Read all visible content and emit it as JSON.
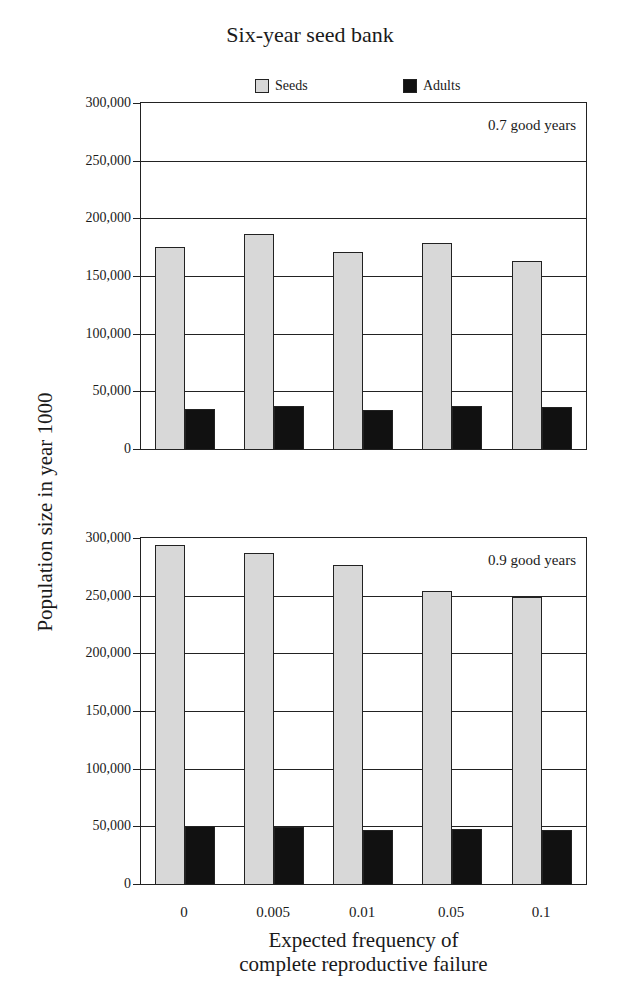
{
  "chart_data": [
    {
      "type": "bar",
      "title": "Six-year seed bank",
      "panel_label": "0.7 good years",
      "xlabel": "Expected frequency of complete reproductive failure",
      "ylabel": "Population size in year 1000",
      "categories": [
        "0",
        "0.005",
        "0.01",
        "0.05",
        "0.1"
      ],
      "series": [
        {
          "name": "Seeds",
          "values": [
            175000,
            186000,
            171000,
            179000,
            163000
          ]
        },
        {
          "name": "Adults",
          "values": [
            34500,
            37000,
            33500,
            37000,
            36000
          ]
        }
      ],
      "ylim": [
        0,
        300000
      ],
      "yticks": [
        "0",
        "50,000",
        "100,000",
        "150,000",
        "200,000",
        "250,000",
        "300,000"
      ],
      "grid": true,
      "legend_position": "top"
    },
    {
      "type": "bar",
      "title": "Six-year seed bank",
      "panel_label": "0.9 good years",
      "xlabel": "Expected frequency of complete reproductive failure",
      "ylabel": "Population size in year 1000",
      "categories": [
        "0",
        "0.005",
        "0.01",
        "0.05",
        "0.1"
      ],
      "series": [
        {
          "name": "Seeds",
          "values": [
            294000,
            287000,
            277000,
            254000,
            249000
          ]
        },
        {
          "name": "Adults",
          "values": [
            50000,
            49500,
            47000,
            47500,
            47000
          ]
        }
      ],
      "ylim": [
        0,
        300000
      ],
      "yticks": [
        "0",
        "50,000",
        "100,000",
        "150,000",
        "200,000",
        "250,000",
        "300,000"
      ],
      "grid": true,
      "legend_position": "top"
    }
  ],
  "title": "Six-year seed bank",
  "legend": {
    "seeds": "Seeds",
    "adults": "Adults"
  },
  "colors": {
    "seeds": "#d8d8d8",
    "adults": "#111111",
    "axis": "#222222"
  },
  "xlabel_line1": "Expected frequency of",
  "xlabel_line2": "complete reproductive failure",
  "ylabel": "Population size in year 1000"
}
